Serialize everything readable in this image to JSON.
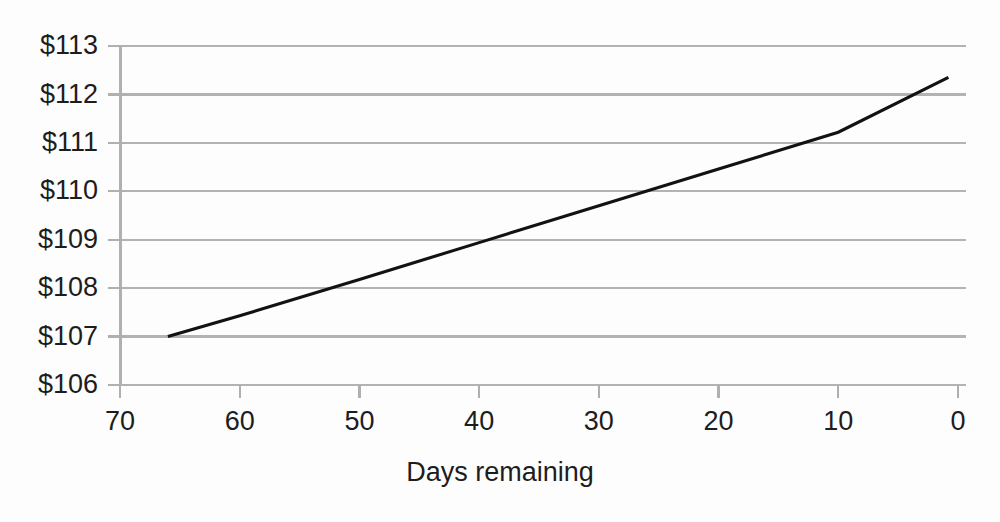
{
  "chart_data": {
    "type": "line",
    "title": "",
    "subtitle": "",
    "xlabel": "Days remaining",
    "ylabel": "",
    "xlim": [
      70,
      0
    ],
    "ylim": [
      106,
      113
    ],
    "x_ticks": [
      70,
      60,
      50,
      40,
      30,
      20,
      10,
      0
    ],
    "x_tick_labels": [
      "70",
      "60",
      "50",
      "40",
      "30",
      "20",
      "10",
      "0"
    ],
    "y_ticks": [
      106,
      107,
      108,
      109,
      110,
      111,
      112,
      113
    ],
    "y_tick_labels": [
      "$106",
      "$107",
      "$108",
      "$109",
      "$110",
      "$111",
      "$112",
      "$113"
    ],
    "x_axis_inverted": true,
    "grid": "horizontal",
    "legend": "none",
    "series": [
      {
        "name": "Option value",
        "color": "#121212",
        "x": [
          66,
          60,
          50,
          40,
          30,
          20,
          10,
          0.8
        ],
        "y": [
          107.0,
          107.43,
          108.18,
          108.94,
          109.7,
          110.46,
          111.22,
          112.35
        ],
        "points": [
          {
            "x": 66,
            "y": 107.0
          },
          {
            "x": 0.8,
            "y": 112.35
          }
        ]
      }
    ],
    "annotations": [],
    "colors": {
      "line": "#121212",
      "grid": "#b3b3b3",
      "axis": "#b0b0b0",
      "text": "#1d1d1d",
      "background": "#fdfdfd"
    }
  },
  "axis_geometry": {
    "plot_left": 120,
    "plot_right": 958,
    "plot_top": 46,
    "plot_bottom": 385,
    "grid_right_extent": 966
  }
}
